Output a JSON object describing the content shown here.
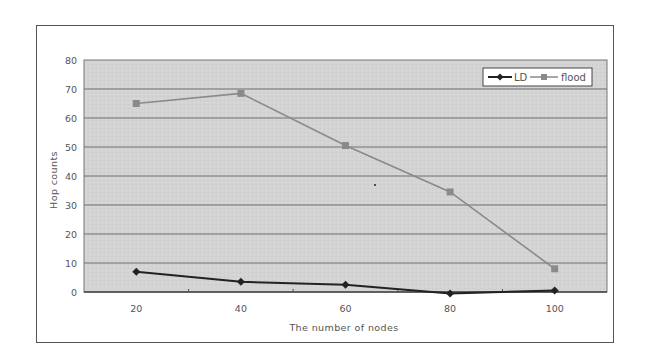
{
  "chart_data": {
    "type": "line",
    "title": "",
    "xlabel": "The number of nodes",
    "ylabel": "Hop counts",
    "categories": [
      "20",
      "40",
      "60",
      "80",
      "100"
    ],
    "series": [
      {
        "name": "LD",
        "color": "#222222",
        "marker": "diamond",
        "values": [
          7,
          3.5,
          2.5,
          -0.5,
          0.5
        ]
      },
      {
        "name": "flood",
        "color": "#8a8a8a",
        "marker": "square",
        "values": [
          65,
          68.5,
          50.5,
          34.5,
          8
        ]
      }
    ],
    "ylim": [
      0,
      80
    ],
    "yticks": [
      "0",
      "10",
      "20",
      "30",
      "40",
      "50",
      "60",
      "70",
      "80"
    ],
    "grid": true,
    "legend_position": "top-right",
    "plot_background": "#d3d3d3"
  }
}
